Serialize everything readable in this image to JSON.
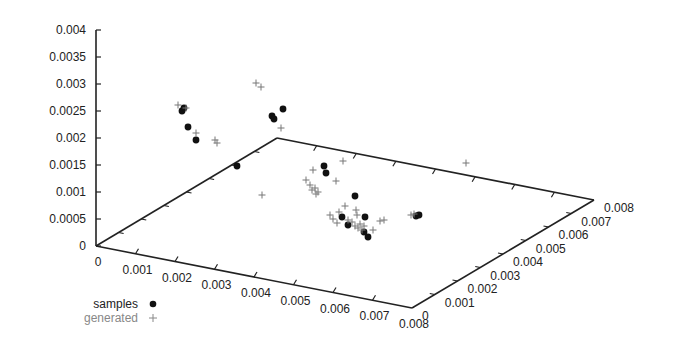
{
  "chart_data": {
    "type": "scatter",
    "subtype": "3d-scatter",
    "title": "",
    "xlabel": "",
    "ylabel": "",
    "zlabel": "",
    "axes": {
      "x": {
        "range": [
          0,
          0.008
        ],
        "ticks": [
          "0",
          "0.001",
          "0.002",
          "0.003",
          "0.004",
          "0.005",
          "0.006",
          "0.007",
          "0.008"
        ]
      },
      "y": {
        "range": [
          0,
          0.008
        ],
        "ticks": [
          "0",
          "0.001",
          "0.002",
          "0.003",
          "0.004",
          "0.005",
          "0.006",
          "0.007",
          "0.008"
        ]
      },
      "z": {
        "range": [
          0,
          0.004
        ],
        "ticks": [
          "0",
          "0.0005",
          "0.001",
          "0.0015",
          "0.002",
          "0.0025",
          "0.003",
          "0.0035",
          "0.004"
        ]
      }
    },
    "grid": false,
    "legend": {
      "position": "bottom-left",
      "entries": [
        "samples",
        "generated"
      ]
    },
    "series": [
      {
        "name": "samples",
        "marker": "filled-circle",
        "color": "#111111",
        "screen_points": [
          [
            182,
            111
          ],
          [
            184,
            108
          ],
          [
            188,
            127
          ],
          [
            196,
            140
          ],
          [
            237,
            166
          ],
          [
            272,
            116
          ],
          [
            274,
            119
          ],
          [
            283,
            109
          ],
          [
            324,
            166
          ],
          [
            326,
            173
          ],
          [
            355,
            196
          ],
          [
            342,
            217
          ],
          [
            365,
            217
          ],
          [
            348,
            225
          ],
          [
            364,
            232
          ],
          [
            368,
            237
          ],
          [
            416,
            216
          ],
          [
            419,
            215
          ]
        ]
      },
      {
        "name": "generated",
        "marker": "plus",
        "color": "#777777",
        "screen_points": [
          [
            178,
            105
          ],
          [
            186,
            108
          ],
          [
            196,
            133
          ],
          [
            215,
            140
          ],
          [
            217,
            143
          ],
          [
            256,
            83
          ],
          [
            261,
            87
          ],
          [
            281,
            128
          ],
          [
            262,
            195
          ],
          [
            313,
            170
          ],
          [
            343,
            161
          ],
          [
            336,
            181
          ],
          [
            466,
            163
          ],
          [
            306,
            180
          ],
          [
            310,
            185
          ],
          [
            312,
            190
          ],
          [
            315,
            188
          ],
          [
            316,
            194
          ],
          [
            318,
            192
          ],
          [
            330,
            215
          ],
          [
            333,
            219
          ],
          [
            337,
            223
          ],
          [
            339,
            212
          ],
          [
            345,
            206
          ],
          [
            348,
            220
          ],
          [
            352,
            222
          ],
          [
            355,
            226
          ],
          [
            358,
            228
          ],
          [
            360,
            224
          ],
          [
            362,
            230
          ],
          [
            364,
            226
          ],
          [
            356,
            210
          ],
          [
            357,
            215
          ],
          [
            373,
            230
          ],
          [
            380,
            221
          ],
          [
            384,
            220
          ],
          [
            411,
            215
          ],
          [
            414,
            214
          ]
        ]
      }
    ]
  },
  "legend": {
    "samples_label": "samples",
    "generated_label": "generated"
  }
}
